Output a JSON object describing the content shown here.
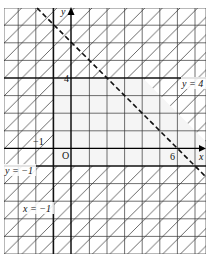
{
  "diagram": {
    "type": "linear-inequality-region",
    "axes": {
      "x_label": "x",
      "y_label": "y",
      "origin_label": "O"
    },
    "tick_labels": {
      "x_neg1": "−1",
      "y_4": "4",
      "x_6": "6"
    },
    "boundary_lines": [
      {
        "id": "y4",
        "label": "y = 4",
        "style": "solid"
      },
      {
        "id": "yneg1",
        "label": "y = −1",
        "style": "solid"
      },
      {
        "id": "xneg1",
        "label": "x = −1",
        "style": "solid"
      },
      {
        "id": "xy6",
        "label": "",
        "equation": "x + y = 6",
        "style": "dashed"
      }
    ],
    "colors": {
      "grid": "#333333",
      "hatch": "#444444",
      "background": "#ffffff",
      "unshaded": "#f4f4f4"
    }
  }
}
